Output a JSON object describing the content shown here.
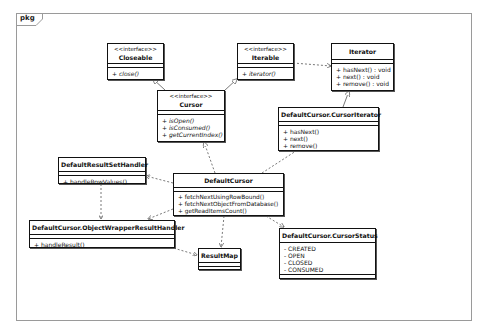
{
  "diagram": {
    "type": "uml-class-diagram",
    "frame_label": "pkg",
    "classes": [
      {
        "id": "closeable",
        "stereotype": "<<interface>>",
        "name": "Closeable",
        "attributes": [],
        "operations": [
          "+ close()"
        ],
        "abstract_ops": true
      },
      {
        "id": "iterable",
        "stereotype": "<<interface>>",
        "name": "Iterable",
        "attributes": [],
        "operations": [
          "+ iterator()"
        ],
        "abstract_ops": true
      },
      {
        "id": "iterator",
        "stereotype": "",
        "name": "Iterator",
        "attributes": [],
        "operations": [
          "+ hasNext() : void",
          "+ next() : void",
          "+ remove() : void"
        ],
        "abstract_ops": false
      },
      {
        "id": "cursor",
        "stereotype": "<<interface>>",
        "name": "Cursor",
        "attributes": [],
        "operations": [
          "+ isOpen()",
          "+ isConsumed()",
          "+ getCurrentIndex()"
        ],
        "abstract_ops": true
      },
      {
        "id": "cursor_iterator",
        "stereotype": "",
        "name": "DefaultCursor.CursorIterator",
        "attributes": [],
        "operations": [
          "+ hasNext()",
          "+ next()",
          "+ remove()"
        ],
        "abstract_ops": false
      },
      {
        "id": "default_result_set_handler",
        "stereotype": "",
        "name": "DefaultResultSetHandler",
        "attributes": [],
        "operations": [
          "+ handleRowValues()"
        ],
        "abstract_ops": false
      },
      {
        "id": "default_cursor",
        "stereotype": "",
        "name": "DefaultCursor",
        "attributes": [],
        "operations": [
          "+ fetchNextUsingRowBound()",
          "+ fetchNextObjectFromDatabase()",
          "+ getReadItemsCount()"
        ],
        "abstract_ops": false
      },
      {
        "id": "object_wrapper_result_handler",
        "stereotype": "",
        "name": "DefaultCursor.ObjectWrapperResultHandler",
        "attributes": [],
        "operations": [
          "+ handleResult()"
        ],
        "abstract_ops": false
      },
      {
        "id": "result_map",
        "stereotype": "",
        "name": "ResultMap",
        "attributes": [],
        "operations": [],
        "abstract_ops": false
      },
      {
        "id": "cursor_status",
        "stereotype": "",
        "name": "DefaultCursor.CursorStatus",
        "attributes": [
          "- CREATED",
          "- OPEN",
          "- CLOSED",
          "- CONSUMED"
        ],
        "operations": [],
        "abstract_ops": false
      }
    ],
    "relationships": [
      {
        "from": "cursor",
        "to": "closeable",
        "type": "generalization"
      },
      {
        "from": "cursor",
        "to": "iterable",
        "type": "generalization"
      },
      {
        "from": "iterable",
        "to": "iterator",
        "type": "dependency"
      },
      {
        "from": "cursor_iterator",
        "to": "iterator",
        "type": "generalization"
      },
      {
        "from": "default_cursor",
        "to": "cursor",
        "type": "realization"
      },
      {
        "from": "default_cursor",
        "to": "cursor_iterator",
        "type": "dependency"
      },
      {
        "from": "default_cursor",
        "to": "default_result_set_handler",
        "type": "dependency"
      },
      {
        "from": "default_cursor",
        "to": "object_wrapper_result_handler",
        "type": "dependency"
      },
      {
        "from": "default_cursor",
        "to": "result_map",
        "type": "dependency"
      },
      {
        "from": "default_cursor",
        "to": "cursor_status",
        "type": "dependency"
      },
      {
        "from": "default_result_set_handler",
        "to": "object_wrapper_result_handler",
        "type": "dependency"
      },
      {
        "from": "object_wrapper_result_handler",
        "to": "result_map",
        "type": "dependency"
      }
    ]
  },
  "colors": {
    "border": "#111111",
    "frame": "#9a9a9a",
    "background": "#ffffff",
    "edge": "#555555"
  }
}
